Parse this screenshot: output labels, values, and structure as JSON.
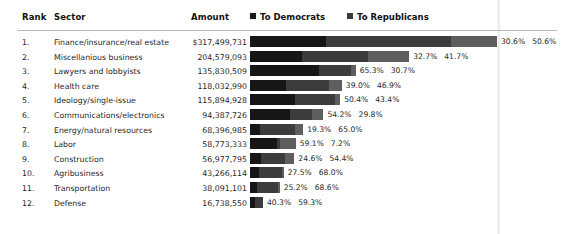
{
  "table": {
    "headers": {
      "rank": "Rank",
      "sector": "Sector",
      "amount": "Amount"
    },
    "legend": [
      {
        "label": "To Democrats",
        "icon": "square-swatch-icon",
        "color": "#161616"
      },
      {
        "label": "To Republicans",
        "icon": "square-swatch-icon",
        "color": "#3c3c3c"
      }
    ],
    "rows": [
      {
        "rank": "1.",
        "sector": "Finance/insurance/real estate",
        "amount": "$317,499,731",
        "amount_value": 317499731,
        "dem_pct": "30.6%",
        "rep_pct": "50.6%",
        "dem_value": 30.6,
        "rep_value": 50.6
      },
      {
        "rank": "2.",
        "sector": "Miscellanious business",
        "amount": "204,579,093",
        "amount_value": 204579093,
        "dem_pct": "32.7%",
        "rep_pct": "41.7%",
        "dem_value": 32.7,
        "rep_value": 41.7
      },
      {
        "rank": "3.",
        "sector": "Lawyers and lobbyists",
        "amount": "135,830,509",
        "amount_value": 135830509,
        "dem_pct": "65.3%",
        "rep_pct": "30.7%",
        "dem_value": 65.3,
        "rep_value": 30.7
      },
      {
        "rank": "4.",
        "sector": "Health care",
        "amount": "118,032,990",
        "amount_value": 118032990,
        "dem_pct": "39.0%",
        "rep_pct": "46.9%",
        "dem_value": 39.0,
        "rep_value": 46.9
      },
      {
        "rank": "5.",
        "sector": "Ideology/single-issue",
        "amount": "115,894,928",
        "amount_value": 115894928,
        "dem_pct": "50.4%",
        "rep_pct": "43.4%",
        "dem_value": 50.4,
        "rep_value": 43.4
      },
      {
        "rank": "6.",
        "sector": "Communications/electronics",
        "amount": "94,387,726",
        "amount_value": 94387726,
        "dem_pct": "54.2%",
        "rep_pct": "29.8%",
        "dem_value": 54.2,
        "rep_value": 29.8
      },
      {
        "rank": "7.",
        "sector": "Energy/natural resources",
        "amount": "68,396,985",
        "amount_value": 68396985,
        "dem_pct": "19.3%",
        "rep_pct": "65.0%",
        "dem_value": 19.3,
        "rep_value": 65.0
      },
      {
        "rank": "8.",
        "sector": "Labor",
        "amount": "58,773,333",
        "amount_value": 58773333,
        "dem_pct": "59.1%",
        "rep_pct": "7.2%",
        "dem_value": 59.1,
        "rep_value": 7.2
      },
      {
        "rank": "9.",
        "sector": "Construction",
        "amount": "56,977,795",
        "amount_value": 56977795,
        "dem_pct": "24.6%",
        "rep_pct": "54.4%",
        "dem_value": 24.6,
        "rep_value": 54.4
      },
      {
        "rank": "10.",
        "sector": "Agribusiness",
        "amount": "43,266,114",
        "amount_value": 43266114,
        "dem_pct": "27.5%",
        "rep_pct": "68.0%",
        "dem_value": 27.5,
        "rep_value": 68.0
      },
      {
        "rank": "11.",
        "sector": "Transportation",
        "amount": "38,091,101",
        "amount_value": 38091101,
        "dem_pct": "25.2%",
        "rep_pct": "68.6%",
        "dem_value": 25.2,
        "rep_value": 68.6
      },
      {
        "rank": "12.",
        "sector": "Defense",
        "amount": "16,738,550",
        "amount_value": 16738550,
        "dem_pct": "40.3%",
        "rep_pct": "59.3%",
        "dem_value": 40.3,
        "rep_value": 59.3
      }
    ]
  },
  "chart_data": {
    "type": "bar",
    "title": "",
    "xlabel": "",
    "ylabel": "",
    "orientation": "horizontal",
    "stacked": true,
    "categories": [
      "Finance/insurance/real estate",
      "Miscellanious business",
      "Lawyers and lobbyists",
      "Health care",
      "Ideology/single-issue",
      "Communications/electronics",
      "Energy/natural resources",
      "Labor",
      "Construction",
      "Agribusiness",
      "Transportation",
      "Defense"
    ],
    "totals": [
      317499731,
      204579093,
      135830509,
      118032990,
      115894928,
      94387726,
      68396985,
      58773333,
      56977795,
      43266114,
      38091101,
      16738550
    ],
    "series": [
      {
        "name": "To Democrats",
        "color": "#161616",
        "values": [
          30.6,
          32.7,
          65.3,
          39.0,
          50.4,
          54.2,
          19.3,
          59.1,
          24.6,
          27.5,
          25.2,
          40.3
        ]
      },
      {
        "name": "To Republicans",
        "color": "#3c3c3c",
        "values": [
          50.6,
          41.7,
          30.7,
          46.9,
          43.4,
          29.8,
          65.0,
          7.2,
          54.4,
          68.0,
          68.6,
          59.3
        ]
      }
    ],
    "units": "percent of total contributions; bar length proportional to Amount (USD)",
    "legend_position": "top",
    "grid": false
  },
  "style": {
    "bar_max_px": 247,
    "bar_origin_px": 250,
    "accent_dem": "#161616",
    "accent_rep": "#3c3c3c",
    "accent_other": "#5e5e5e",
    "rule_color": "#b9b9b9"
  }
}
